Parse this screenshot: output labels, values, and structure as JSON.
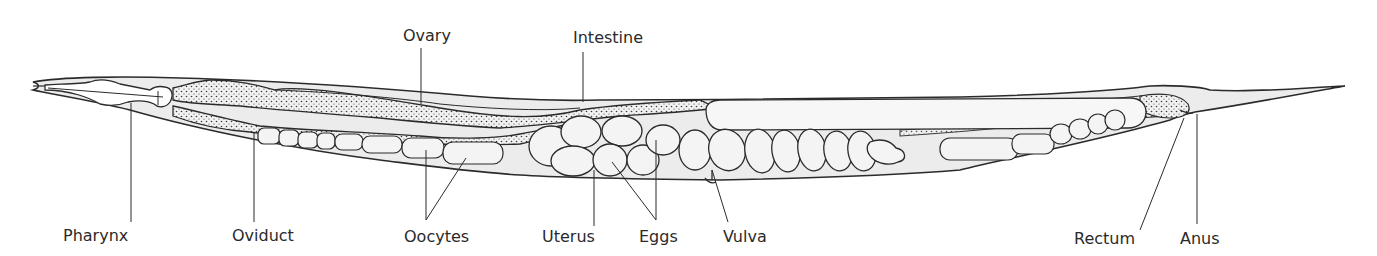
{
  "diagram": {
    "labels": {
      "ovary": "Ovary",
      "intestine": "Intestine",
      "pharynx": "Pharynx",
      "oviduct": "Oviduct",
      "oocytes": "Oocytes",
      "uterus": "Uterus",
      "eggs": "Eggs",
      "vulva": "Vulva",
      "rectum": "Rectum",
      "anus": "Anus"
    },
    "colors": {
      "outline": "#2b2b2b",
      "body_fill": "#ececec",
      "cell_fill": "#f4f4f4",
      "stipple": "#3a3a3a",
      "text": "#2a2a2a",
      "background": "#ffffff"
    }
  }
}
